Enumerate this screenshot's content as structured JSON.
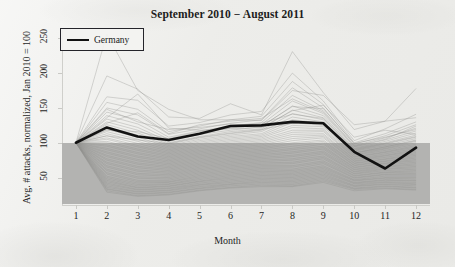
{
  "chart_data": {
    "type": "line",
    "title": "September 2010 − August 2011",
    "xlabel": "Month",
    "ylabel": "Avg. # attacks, normalized, Jan 2010 = 100",
    "x": [
      1,
      2,
      3,
      4,
      5,
      6,
      7,
      8,
      9,
      10,
      11,
      12
    ],
    "xtick_labels": [
      "1",
      "2",
      "3",
      "4",
      "5",
      "6",
      "7",
      "8",
      "9",
      "10",
      "11",
      "12"
    ],
    "xlim": [
      0.55,
      12.45
    ],
    "ytick_labels": [
      "50",
      "100",
      "150",
      "200",
      "250"
    ],
    "yticks": [
      50,
      100,
      150,
      200,
      250
    ],
    "ylim": [
      12,
      262
    ],
    "grid": false,
    "legend_position": "top-left",
    "legend": [
      "Germany"
    ],
    "highlight_color": "#121212",
    "background_color": "#ededea",
    "shaded_band": {
      "label": "below-baseline shading",
      "color": "#b3b3b1",
      "y_top": 100,
      "y_bottom": 12
    },
    "series": [
      {
        "name": "Germany",
        "highlighted": true,
        "color": "#121212",
        "values": [
          100,
          122,
          109,
          104,
          113,
          124,
          125,
          130,
          128,
          87,
          63,
          93
        ]
      },
      {
        "name": "country-01",
        "color": "#8d8d8b",
        "values": [
          100,
          256,
          175,
          148,
          133,
          133,
          132,
          175,
          168,
          126,
          131,
          136
        ]
      },
      {
        "name": "country-02",
        "color": "#8d8d8b",
        "values": [
          100,
          196,
          177,
          137,
          135,
          156,
          140,
          231,
          172,
          119,
          131,
          178
        ]
      },
      {
        "name": "country-03",
        "color": "#8d8d8b",
        "values": [
          100,
          166,
          161,
          124,
          129,
          140,
          145,
          200,
          160,
          103,
          120,
          141
        ]
      },
      {
        "name": "country-04",
        "color": "#8d8d8b",
        "values": [
          100,
          158,
          148,
          116,
          124,
          133,
          138,
          188,
          155,
          100,
          113,
          130
        ]
      },
      {
        "name": "country-05",
        "color": "#8d8d8b",
        "values": [
          100,
          150,
          140,
          112,
          120,
          128,
          133,
          179,
          150,
          98,
          110,
          126
        ]
      },
      {
        "name": "country-06",
        "color": "#8d8d8b",
        "values": [
          100,
          144,
          133,
          108,
          117,
          124,
          129,
          168,
          146,
          96,
          107,
          121
        ]
      },
      {
        "name": "country-07",
        "color": "#8d8d8b",
        "values": [
          100,
          139,
          127,
          105,
          114,
          121,
          126,
          160,
          142,
          94,
          104,
          117
        ]
      },
      {
        "name": "country-08",
        "color": "#8d8d8b",
        "values": [
          100,
          134,
          122,
          102,
          112,
          118,
          123,
          153,
          139,
          92,
          102,
          114
        ]
      },
      {
        "name": "country-09",
        "color": "#8d8d8b",
        "values": [
          100,
          130,
          118,
          100,
          109,
          116,
          120,
          147,
          136,
          91,
          100,
          111
        ]
      },
      {
        "name": "country-10",
        "color": "#8d8d8b",
        "values": [
          100,
          126,
          114,
          98,
          107,
          113,
          118,
          142,
          133,
          89,
          98,
          108
        ]
      },
      {
        "name": "country-11",
        "color": "#8d8d8b",
        "values": [
          100,
          122,
          111,
          96,
          105,
          111,
          116,
          137,
          130,
          88,
          96,
          106
        ]
      },
      {
        "name": "country-12",
        "color": "#8d8d8b",
        "values": [
          100,
          119,
          108,
          94,
          103,
          109,
          113,
          133,
          128,
          86,
          94,
          104
        ]
      },
      {
        "name": "country-13",
        "color": "#8d8d8b",
        "values": [
          100,
          116,
          105,
          92,
          101,
          107,
          111,
          129,
          125,
          85,
          92,
          102
        ]
      },
      {
        "name": "country-14",
        "color": "#8d8d8b",
        "values": [
          100,
          113,
          102,
          90,
          99,
          105,
          109,
          125,
          123,
          83,
          91,
          100
        ]
      },
      {
        "name": "country-15",
        "color": "#8d8d8b",
        "values": [
          100,
          110,
          99,
          88,
          97,
          103,
          107,
          122,
          120,
          82,
          89,
          98
        ]
      },
      {
        "name": "country-16",
        "color": "#8d8d8b",
        "values": [
          100,
          107,
          96,
          86,
          95,
          101,
          105,
          118,
          118,
          80,
          87,
          96
        ]
      },
      {
        "name": "country-17",
        "color": "#8d8d8b",
        "values": [
          100,
          105,
          94,
          84,
          93,
          99,
          103,
          115,
          116,
          79,
          86,
          94
        ]
      },
      {
        "name": "country-18",
        "color": "#8d8d8b",
        "values": [
          100,
          102,
          91,
          82,
          91,
          97,
          101,
          112,
          113,
          77,
          84,
          92
        ]
      },
      {
        "name": "country-19",
        "color": "#8d8d8b",
        "values": [
          100,
          100,
          89,
          80,
          89,
          95,
          99,
          109,
          111,
          76,
          82,
          90
        ]
      },
      {
        "name": "country-20",
        "color": "#8d8d8b",
        "values": [
          100,
          97,
          86,
          78,
          87,
          93,
          97,
          106,
          109,
          74,
          81,
          88
        ]
      },
      {
        "name": "country-21",
        "color": "#8d8d8b",
        "values": [
          100,
          95,
          84,
          76,
          85,
          91,
          95,
          103,
          107,
          73,
          79,
          86
        ]
      },
      {
        "name": "country-22",
        "color": "#8d8d8b",
        "values": [
          100,
          92,
          81,
          74,
          83,
          89,
          93,
          100,
          104,
          71,
          77,
          84
        ]
      },
      {
        "name": "country-23",
        "color": "#8d8d8b",
        "values": [
          100,
          90,
          79,
          72,
          81,
          87,
          91,
          98,
          102,
          70,
          76,
          82
        ]
      },
      {
        "name": "country-24",
        "color": "#8d8d8b",
        "values": [
          100,
          87,
          76,
          70,
          79,
          85,
          89,
          95,
          100,
          68,
          74,
          80
        ]
      },
      {
        "name": "country-25",
        "color": "#8d8d8b",
        "values": [
          100,
          85,
          74,
          68,
          77,
          83,
          87,
          92,
          98,
          67,
          73,
          78
        ]
      },
      {
        "name": "country-26",
        "color": "#8d8d8b",
        "values": [
          100,
          82,
          71,
          66,
          75,
          81,
          85,
          90,
          95,
          65,
          71,
          76
        ]
      },
      {
        "name": "country-27",
        "color": "#8d8d8b",
        "values": [
          100,
          80,
          69,
          64,
          73,
          79,
          83,
          87,
          93,
          64,
          70,
          74
        ]
      },
      {
        "name": "country-28",
        "color": "#8d8d8b",
        "values": [
          100,
          77,
          66,
          62,
          71,
          77,
          81,
          85,
          91,
          62,
          68,
          72
        ]
      },
      {
        "name": "country-29",
        "color": "#8d8d8b",
        "values": [
          100,
          75,
          64,
          60,
          69,
          75,
          79,
          82,
          88,
          61,
          66,
          70
        ]
      },
      {
        "name": "country-30",
        "color": "#8d8d8b",
        "values": [
          100,
          72,
          61,
          58,
          67,
          73,
          77,
          80,
          86,
          59,
          65,
          68
        ]
      },
      {
        "name": "country-31",
        "color": "#8d8d8b",
        "values": [
          100,
          70,
          59,
          56,
          65,
          71,
          75,
          77,
          84,
          58,
          63,
          66
        ]
      },
      {
        "name": "country-32",
        "color": "#8d8d8b",
        "values": [
          100,
          67,
          56,
          54,
          63,
          69,
          73,
          75,
          81,
          56,
          62,
          64
        ]
      },
      {
        "name": "country-33",
        "color": "#8d8d8b",
        "values": [
          100,
          65,
          54,
          52,
          61,
          67,
          71,
          72,
          79,
          55,
          60,
          62
        ]
      },
      {
        "name": "country-34",
        "color": "#8d8d8b",
        "values": [
          100,
          62,
          51,
          50,
          59,
          65,
          69,
          70,
          77,
          53,
          58,
          60
        ]
      },
      {
        "name": "country-35",
        "color": "#8d8d8b",
        "values": [
          100,
          60,
          49,
          48,
          57,
          63,
          67,
          67,
          74,
          52,
          57,
          58
        ]
      },
      {
        "name": "country-36",
        "color": "#8d8d8b",
        "values": [
          100,
          57,
          46,
          46,
          55,
          61,
          65,
          65,
          72,
          50,
          55,
          56
        ]
      },
      {
        "name": "country-37",
        "color": "#8d8d8b",
        "values": [
          100,
          55,
          44,
          44,
          53,
          59,
          63,
          62,
          70,
          49,
          54,
          54
        ]
      },
      {
        "name": "country-38",
        "color": "#8d8d8b",
        "values": [
          100,
          52,
          42,
          43,
          51,
          57,
          61,
          60,
          67,
          47,
          52,
          52
        ]
      },
      {
        "name": "country-39",
        "color": "#8d8d8b",
        "values": [
          100,
          50,
          40,
          41,
          49,
          55,
          59,
          58,
          65,
          46,
          50,
          50
        ]
      },
      {
        "name": "country-40",
        "color": "#8d8d8b",
        "values": [
          100,
          48,
          38,
          40,
          47,
          53,
          57,
          56,
          63,
          45,
          49,
          48
        ]
      },
      {
        "name": "country-41",
        "color": "#8d8d8b",
        "values": [
          100,
          46,
          36,
          38,
          45,
          51,
          55,
          54,
          61,
          43,
          47,
          46
        ]
      },
      {
        "name": "country-42",
        "color": "#8d8d8b",
        "values": [
          100,
          44,
          35,
          37,
          44,
          49,
          53,
          52,
          59,
          42,
          46,
          45
        ]
      },
      {
        "name": "country-43",
        "color": "#8d8d8b",
        "values": [
          100,
          42,
          33,
          35,
          42,
          47,
          51,
          50,
          57,
          41,
          44,
          43
        ]
      },
      {
        "name": "country-44",
        "color": "#8d8d8b",
        "values": [
          100,
          40,
          32,
          34,
          40,
          45,
          49,
          48,
          55,
          39,
          43,
          41
        ]
      },
      {
        "name": "country-45",
        "color": "#8d8d8b",
        "values": [
          100,
          38,
          30,
          32,
          39,
          43,
          47,
          46,
          53,
          38,
          41,
          40
        ]
      },
      {
        "name": "country-46",
        "color": "#8d8d8b",
        "values": [
          100,
          36,
          29,
          31,
          37,
          41,
          45,
          44,
          51,
          37,
          40,
          38
        ]
      },
      {
        "name": "country-47",
        "color": "#8d8d8b",
        "values": [
          100,
          34,
          27,
          29,
          35,
          40,
          43,
          42,
          49,
          35,
          38,
          36
        ]
      },
      {
        "name": "country-48",
        "color": "#8d8d8b",
        "values": [
          100,
          33,
          26,
          28,
          34,
          38,
          41,
          40,
          47,
          34,
          37,
          35
        ]
      },
      {
        "name": "country-49",
        "color": "#8d8d8b",
        "values": [
          100,
          31,
          24,
          26,
          32,
          36,
          39,
          38,
          45,
          33,
          35,
          33
        ]
      },
      {
        "name": "country-50",
        "color": "#8d8d8b",
        "values": [
          100,
          29,
          23,
          25,
          31,
          35,
          37,
          37,
          43,
          31,
          34,
          32
        ]
      },
      {
        "name": "country-51",
        "color": "#8d8d8b",
        "values": [
          100,
          148,
          130,
          119,
          122,
          127,
          124,
          152,
          149,
          99,
          108,
          119
        ]
      },
      {
        "name": "country-52",
        "color": "#8d8d8b",
        "values": [
          100,
          136,
          170,
          121,
          118,
          120,
          122,
          146,
          154,
          108,
          118,
          112
        ]
      },
      {
        "name": "country-53",
        "color": "#8d8d8b",
        "values": [
          100,
          128,
          143,
          113,
          126,
          131,
          135,
          163,
          144,
          95,
          105,
          124
        ]
      },
      {
        "name": "country-54",
        "color": "#8d8d8b",
        "values": [
          100,
          118,
          116,
          106,
          116,
          122,
          128,
          141,
          135,
          90,
          99,
          109
        ]
      },
      {
        "name": "country-55",
        "color": "#8d8d8b",
        "values": [
          100,
          110,
          104,
          99,
          108,
          114,
          119,
          128,
          127,
          85,
          94,
          103
        ]
      }
    ]
  }
}
